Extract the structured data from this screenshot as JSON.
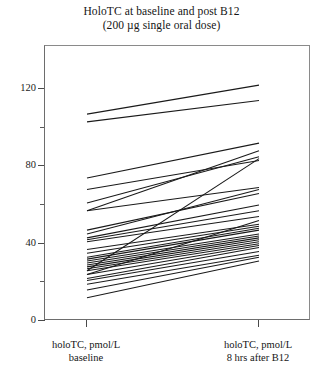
{
  "chart_data": {
    "type": "line",
    "title": "HoloTC at baseline and post B12",
    "subtitle": "(200 µg single oral dose)",
    "xlabel": "",
    "ylabel": "",
    "categories": [
      "holoTC, pmol/L baseline",
      "holoTC, pmol/L 8 hrs after B12"
    ],
    "x": [
      0,
      1
    ],
    "ylim": [
      0,
      130
    ],
    "yticks_major": [
      0,
      40,
      80,
      120
    ],
    "yticks_minor": [
      20,
      60,
      100
    ],
    "ytick_labels": [
      "0",
      "40",
      "80",
      "120"
    ],
    "grid": false,
    "legend": "none",
    "units": "pmol/L",
    "n_subjects": 30,
    "series": [
      {
        "name": "subject-01",
        "values": [
          107,
          122
        ]
      },
      {
        "name": "subject-02",
        "values": [
          103,
          114
        ]
      },
      {
        "name": "subject-03",
        "values": [
          74,
          92
        ]
      },
      {
        "name": "subject-04",
        "values": [
          57,
          88
        ]
      },
      {
        "name": "subject-05",
        "values": [
          61,
          85
        ]
      },
      {
        "name": "subject-06",
        "values": [
          68,
          83
        ]
      },
      {
        "name": "subject-07",
        "values": [
          26,
          84
        ]
      },
      {
        "name": "subject-08",
        "values": [
          57,
          69
        ]
      },
      {
        "name": "subject-09",
        "values": [
          45,
          68
        ]
      },
      {
        "name": "subject-10",
        "values": [
          47,
          66
        ]
      },
      {
        "name": "subject-11",
        "values": [
          43,
          60
        ]
      },
      {
        "name": "subject-12",
        "values": [
          42,
          57
        ]
      },
      {
        "name": "subject-13",
        "values": [
          41,
          54
        ]
      },
      {
        "name": "subject-14",
        "values": [
          24,
          52
        ]
      },
      {
        "name": "subject-15",
        "values": [
          37,
          50
        ]
      },
      {
        "name": "subject-16",
        "values": [
          35,
          49
        ]
      },
      {
        "name": "subject-17",
        "values": [
          33,
          48
        ]
      },
      {
        "name": "subject-18",
        "values": [
          32,
          47
        ]
      },
      {
        "name": "subject-19",
        "values": [
          31,
          45
        ]
      },
      {
        "name": "subject-20",
        "values": [
          30,
          44
        ]
      },
      {
        "name": "subject-21",
        "values": [
          29,
          43
        ]
      },
      {
        "name": "subject-22",
        "values": [
          28,
          42
        ]
      },
      {
        "name": "subject-23",
        "values": [
          27,
          41
        ]
      },
      {
        "name": "subject-24",
        "values": [
          26,
          40
        ]
      },
      {
        "name": "subject-25",
        "values": [
          24,
          39
        ]
      },
      {
        "name": "subject-26",
        "values": [
          22,
          38
        ]
      },
      {
        "name": "subject-27",
        "values": [
          21,
          36
        ]
      },
      {
        "name": "subject-28",
        "values": [
          19,
          34
        ]
      },
      {
        "name": "subject-29",
        "values": [
          16,
          33
        ]
      },
      {
        "name": "subject-30",
        "values": [
          12,
          31
        ]
      }
    ],
    "line_color": "#1a1a1a",
    "axis_color": "#6d6d6d"
  },
  "axes": {
    "x_tick_positions": [
      86,
      258
    ],
    "line_x_start": 86,
    "line_x_end": 258
  }
}
